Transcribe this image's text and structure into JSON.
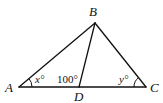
{
  "figure": {
    "type": "triangle-diagram",
    "vertices": {
      "A": {
        "label": "A",
        "x": 19,
        "y": 87
      },
      "B": {
        "label": "B",
        "x": 95,
        "y": 23
      },
      "C": {
        "label": "C",
        "x": 146,
        "y": 87
      },
      "D": {
        "label": "D",
        "x": 79,
        "y": 87
      }
    },
    "segments": [
      "AB",
      "BC",
      "AC",
      "BD"
    ],
    "angles": {
      "A": {
        "text": "x°",
        "var": "x",
        "unit": "°"
      },
      "ADB": {
        "text": "100°",
        "value": "100",
        "unit": "°"
      },
      "C": {
        "text": "y°",
        "var": "y",
        "unit": "°"
      }
    }
  }
}
